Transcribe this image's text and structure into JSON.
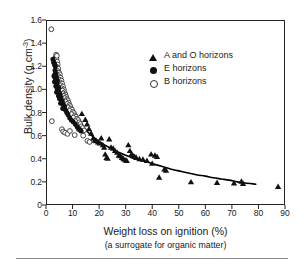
{
  "chart_data": {
    "type": "scatter",
    "title": "",
    "xlabel": "Weight loss on ignition (%)",
    "xlabel_sub": "(a surrogate for organic matter)",
    "ylabel_prefix": "Bulk density (g cm",
    "ylabel_exponent": "-3",
    "ylabel_suffix": ")",
    "xlim": [
      0,
      90
    ],
    "ylim": [
      0,
      1.6
    ],
    "xticks": [
      0,
      10,
      20,
      30,
      40,
      50,
      60,
      70,
      80,
      90
    ],
    "yticks": [
      "0",
      "0.2",
      "0.4",
      "0.6",
      "0.8",
      "1.0",
      "1.2",
      "1.4",
      "1.6"
    ],
    "grid": false,
    "legend_position": "upper-right",
    "marker_color": "#111111",
    "curve_color": "#000000",
    "axis_color": "#222222",
    "legend": [
      {
        "marker": "filled-triangle",
        "label": "A and O horizons"
      },
      {
        "marker": "filled-circle",
        "label": "E horizons"
      },
      {
        "marker": "open-circle",
        "label": "B horizons"
      }
    ],
    "series": [
      {
        "name": "A and O horizons",
        "marker": "filled-triangle",
        "points": [
          [
            13.5,
            0.79
          ],
          [
            14.8,
            0.74
          ],
          [
            15.5,
            0.7
          ],
          [
            16.2,
            0.66
          ],
          [
            17.0,
            0.62
          ],
          [
            17.8,
            0.58
          ],
          [
            18.4,
            0.56
          ],
          [
            19.0,
            0.555
          ],
          [
            19.6,
            0.545
          ],
          [
            20.2,
            0.535
          ],
          [
            20.8,
            0.58
          ],
          [
            21.4,
            0.52
          ],
          [
            21.9,
            0.5
          ],
          [
            22.3,
            0.44
          ],
          [
            22.8,
            0.41
          ],
          [
            23.2,
            0.405
          ],
          [
            23.8,
            0.57
          ],
          [
            24.5,
            0.5
          ],
          [
            25.3,
            0.49
          ],
          [
            26.0,
            0.47
          ],
          [
            26.8,
            0.455
          ],
          [
            27.4,
            0.43
          ],
          [
            28.0,
            0.425
          ],
          [
            28.6,
            0.41
          ],
          [
            29.2,
            0.4
          ],
          [
            29.8,
            0.39
          ],
          [
            30.4,
            0.385
          ],
          [
            31.0,
            0.52
          ],
          [
            31.6,
            0.47
          ],
          [
            32.2,
            0.44
          ],
          [
            32.8,
            0.425
          ],
          [
            33.4,
            0.42
          ],
          [
            34.0,
            0.41
          ],
          [
            35.2,
            0.4
          ],
          [
            36.5,
            0.395
          ],
          [
            38.0,
            0.385
          ],
          [
            39.6,
            0.44
          ],
          [
            40.0,
            0.36
          ],
          [
            41.0,
            0.43
          ],
          [
            41.8,
            0.42
          ],
          [
            42.6,
            0.24
          ],
          [
            44.6,
            0.31
          ],
          [
            45.2,
            0.3
          ],
          [
            54.6,
            0.2
          ],
          [
            64.4,
            0.195
          ],
          [
            70.8,
            0.19
          ],
          [
            73.6,
            0.205
          ],
          [
            74.2,
            0.185
          ],
          [
            87.4,
            0.16
          ]
        ]
      },
      {
        "name": "E horizons",
        "marker": "filled-circle",
        "points": [
          [
            2.6,
            1.26
          ],
          [
            2.9,
            1.235
          ],
          [
            3.1,
            1.225
          ],
          [
            3.3,
            1.21
          ],
          [
            3.5,
            1.2
          ],
          [
            3.4,
            1.165
          ],
          [
            3.6,
            1.14
          ],
          [
            3.2,
            1.125
          ],
          [
            3.0,
            1.115
          ],
          [
            3.4,
            1.1
          ],
          [
            3.8,
            1.12
          ],
          [
            4.0,
            1.09
          ],
          [
            3.6,
            1.075
          ],
          [
            3.2,
            1.065
          ],
          [
            3.9,
            1.055
          ],
          [
            4.3,
            1.07
          ],
          [
            4.1,
            1.04
          ],
          [
            3.7,
            1.03
          ],
          [
            4.5,
            1.02
          ],
          [
            4.2,
            1.005
          ],
          [
            4.8,
            1.015
          ],
          [
            4.6,
            0.99
          ],
          [
            4.0,
            0.975
          ],
          [
            5.0,
            0.97
          ],
          [
            5.3,
            0.955
          ],
          [
            4.7,
            0.945
          ],
          [
            5.6,
            0.93
          ],
          [
            5.1,
            0.92
          ],
          [
            5.9,
            0.905
          ],
          [
            6.2,
            0.89
          ],
          [
            5.5,
            0.88
          ],
          [
            6.6,
            0.865
          ],
          [
            7.0,
            0.85
          ],
          [
            6.3,
            0.835
          ],
          [
            7.4,
            0.82
          ],
          [
            7.8,
            0.8
          ],
          [
            8.3,
            0.78
          ],
          [
            8.9,
            0.755
          ],
          [
            9.5,
            0.735
          ],
          [
            10.2,
            0.72
          ],
          [
            11.0,
            0.7
          ],
          [
            11.8,
            0.675
          ],
          [
            12.6,
            0.655
          ],
          [
            13.2,
            0.64
          ]
        ]
      },
      {
        "name": "B horizons",
        "marker": "open-circle",
        "points": [
          [
            2.0,
            1.52
          ],
          [
            3.6,
            1.275
          ],
          [
            3.9,
            1.265
          ],
          [
            4.2,
            1.24
          ],
          [
            4.4,
            1.215
          ],
          [
            4.0,
            1.195
          ],
          [
            4.6,
            1.18
          ],
          [
            4.3,
            1.16
          ],
          [
            4.9,
            1.145
          ],
          [
            5.2,
            1.13
          ],
          [
            4.7,
            1.115
          ],
          [
            5.5,
            1.1
          ],
          [
            5.0,
            1.085
          ],
          [
            5.8,
            1.075
          ],
          [
            5.3,
            1.06
          ],
          [
            6.1,
            1.05
          ],
          [
            5.6,
            1.035
          ],
          [
            6.4,
            1.025
          ],
          [
            5.9,
            1.01
          ],
          [
            6.7,
            1.0
          ],
          [
            6.2,
            0.99
          ],
          [
            7.0,
            0.975
          ],
          [
            6.5,
            0.965
          ],
          [
            7.3,
            0.955
          ],
          [
            6.8,
            0.945
          ],
          [
            7.6,
            0.935
          ],
          [
            7.1,
            0.925
          ],
          [
            7.9,
            0.915
          ],
          [
            8.2,
            0.905
          ],
          [
            7.4,
            0.895
          ],
          [
            8.5,
            0.885
          ],
          [
            8.0,
            0.875
          ],
          [
            8.8,
            0.865
          ],
          [
            9.1,
            0.855
          ],
          [
            8.3,
            0.845
          ],
          [
            9.4,
            0.835
          ],
          [
            9.8,
            0.825
          ],
          [
            8.9,
            0.815
          ],
          [
            10.1,
            0.805
          ],
          [
            10.5,
            0.795
          ],
          [
            9.6,
            0.785
          ],
          [
            10.9,
            0.775
          ],
          [
            11.3,
            0.765
          ],
          [
            10.3,
            0.755
          ],
          [
            11.7,
            0.745
          ],
          [
            12.1,
            0.735
          ],
          [
            11.0,
            0.725
          ],
          [
            2.2,
            0.725
          ],
          [
            12.5,
            0.715
          ],
          [
            12.9,
            0.7
          ],
          [
            11.5,
            0.69
          ],
          [
            13.3,
            0.68
          ],
          [
            13.8,
            0.665
          ],
          [
            12.3,
            0.655
          ],
          [
            14.3,
            0.645
          ],
          [
            6.0,
            0.655
          ],
          [
            6.5,
            0.635
          ],
          [
            7.2,
            0.625
          ],
          [
            8.1,
            0.615
          ],
          [
            9.0,
            0.64
          ],
          [
            15.6,
            0.555
          ],
          [
            16.4,
            0.545
          ],
          [
            14.0,
            0.6
          ],
          [
            10.8,
            0.605
          ],
          [
            3.8,
            1.3
          ],
          [
            4.1,
            1.29
          ]
        ]
      }
    ],
    "fit_curve": {
      "label": "fitted decay curve",
      "x_start": 7.0,
      "x_end": 79.0,
      "points": [
        [
          7.0,
          0.94
        ],
        [
          8.0,
          0.89
        ],
        [
          9.0,
          0.845
        ],
        [
          10.0,
          0.8
        ],
        [
          11.0,
          0.765
        ],
        [
          12.0,
          0.73
        ],
        [
          13.0,
          0.7
        ],
        [
          14.0,
          0.675
        ],
        [
          15.0,
          0.65
        ],
        [
          16.0,
          0.625
        ],
        [
          17.0,
          0.605
        ],
        [
          18.0,
          0.585
        ],
        [
          19.0,
          0.565
        ],
        [
          20.0,
          0.55
        ],
        [
          22.0,
          0.52
        ],
        [
          24.0,
          0.495
        ],
        [
          26.0,
          0.47
        ],
        [
          28.0,
          0.45
        ],
        [
          30.0,
          0.43
        ],
        [
          33.0,
          0.405
        ],
        [
          36.0,
          0.385
        ],
        [
          39.0,
          0.365
        ],
        [
          42.0,
          0.345
        ],
        [
          45.0,
          0.325
        ],
        [
          48.0,
          0.305
        ],
        [
          51.0,
          0.29
        ],
        [
          54.0,
          0.275
        ],
        [
          57.0,
          0.26
        ],
        [
          60.0,
          0.25
        ],
        [
          63.0,
          0.235
        ],
        [
          66.0,
          0.225
        ],
        [
          69.0,
          0.215
        ],
        [
          72.0,
          0.2
        ],
        [
          75.0,
          0.19
        ],
        [
          79.0,
          0.18
        ]
      ]
    }
  }
}
